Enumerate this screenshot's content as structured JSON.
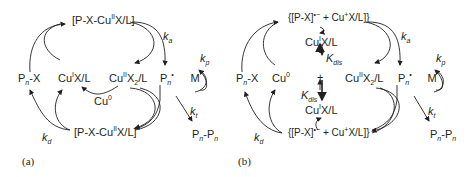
{
  "panel_a": {
    "caption": "(a)",
    "top_complex": {
      "pre": "[P-X-Cu",
      "sup": "II",
      "post": "X/L]"
    },
    "bottom_complex": {
      "pre": "[P-X-Cu",
      "sup": "II",
      "post": "X/L]"
    },
    "dormant": {
      "p": "P",
      "sub": "n",
      "post": "-X"
    },
    "activator": {
      "pre": "Cu",
      "sup": "I",
      "post": "X/L"
    },
    "deactivator": {
      "pre": "Cu",
      "sup": "II",
      "mid": "X",
      "sub": "2",
      "post": "/L"
    },
    "copper0": {
      "pre": "Cu",
      "sup": "0"
    },
    "radical": {
      "p": "P",
      "sub": "n",
      "sup": "•"
    },
    "monomer": "M",
    "termination": {
      "p1": "P",
      "sub1": "n",
      "dash": "-",
      "p2": "P",
      "sub2": "n"
    },
    "rates": {
      "ka": {
        "k": "k",
        "sub": "a"
      },
      "kp": {
        "k": "k",
        "sub": "p"
      },
      "kt": {
        "k": "k",
        "sub": "t"
      },
      "kd": {
        "k": "k",
        "sub": "d"
      }
    }
  },
  "panel_b": {
    "caption": "(b)",
    "top_complex": {
      "pre": "{[P-X]",
      "sup": "•−",
      "mid": " + Cu",
      "sup2": "+",
      "post": "X/L]}"
    },
    "bottom_complex": {
      "pre": "{[P-X]",
      "sup": "•−",
      "mid": " + Cu",
      "sup2": "+",
      "post": "X/L]}"
    },
    "dormant": {
      "p": "P",
      "sub": "n",
      "post": "-X"
    },
    "copper0": {
      "pre": "Cu",
      "sup": "0"
    },
    "cu1_top": {
      "pre": "Cu",
      "sup": "I",
      "post": "X/L"
    },
    "cu1_bottom": {
      "pre": "Cu",
      "sup": "I",
      "post": "X/L"
    },
    "plus": "+",
    "kdis_top": {
      "k": "K",
      "sub": "dis"
    },
    "kdis_bottom": {
      "k": "K",
      "sub": "dis"
    },
    "deactivator": {
      "pre": "Cu",
      "sup": "II",
      "mid": "X",
      "sub": "2",
      "post": "/L"
    },
    "radical": {
      "p": "P",
      "sub": "n",
      "sup": "•"
    },
    "monomer": "M",
    "termination": {
      "p1": "P",
      "sub1": "n",
      "dash": "-",
      "p2": "P",
      "sub2": "n"
    },
    "rates": {
      "ka": {
        "k": "k",
        "sub": "a"
      },
      "kp": {
        "k": "k",
        "sub": "p"
      },
      "kt": {
        "k": "k",
        "sub": "t"
      },
      "kd": {
        "k": "k",
        "sub": "d"
      }
    }
  }
}
